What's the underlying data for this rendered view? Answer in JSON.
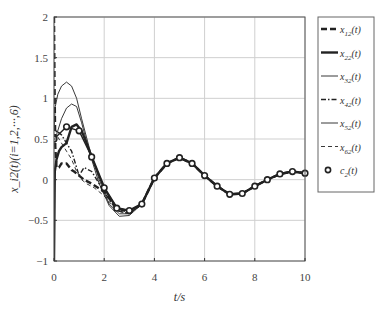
{
  "chart_data": {
    "type": "line",
    "title": "",
    "xlabel": "t/s",
    "ylabel": "x_i2(t)(i=1,2,···,6)",
    "xlim": [
      0,
      10
    ],
    "ylim": [
      -1,
      2
    ],
    "xticks": [
      0,
      2,
      4,
      6,
      8,
      10
    ],
    "yticks": [
      -1,
      -0.5,
      0,
      0.5,
      1,
      1.5,
      2
    ],
    "ytick_labels": [
      "−1",
      "−0.5",
      "0",
      "0.5",
      "1",
      "1.5",
      "2"
    ],
    "grid": true,
    "legend_position": "right-outside",
    "series": [
      {
        "name": "x12(t)",
        "label_main": "x",
        "label_sub": "12",
        "label_tail": "(t)",
        "style": "thick-dashed",
        "x": [
          0,
          0.02,
          0.05,
          0.1,
          0.2,
          0.3,
          0.5,
          0.7,
          0.8,
          1.0,
          1.2,
          1.5,
          2.0,
          2.5,
          3.0,
          3.5,
          4.0,
          4.5,
          5.0,
          5.5,
          6.0,
          6.5,
          7.0,
          7.5,
          8.0,
          8.5,
          9.0,
          9.5,
          10.0
        ],
        "values": [
          2.0,
          1.2,
          0.4,
          0.15,
          0.15,
          0.2,
          0.2,
          0.12,
          0.1,
          0.05,
          0.0,
          -0.05,
          -0.15,
          -0.35,
          -0.4,
          -0.3,
          0.02,
          0.2,
          0.27,
          0.2,
          0.05,
          -0.08,
          -0.18,
          -0.17,
          -0.08,
          0.0,
          0.07,
          0.1,
          0.08
        ]
      },
      {
        "name": "x22(t)",
        "label_main": "x",
        "label_sub": "22",
        "label_tail": "(t)",
        "style": "thick-solid",
        "x": [
          0,
          0.03,
          0.1,
          0.2,
          0.3,
          0.5,
          0.7,
          0.9,
          1.1,
          1.3,
          1.5,
          2.0,
          2.5,
          3.0,
          3.5,
          4.0,
          4.5,
          5.0,
          5.5,
          6.0,
          6.5,
          7.0,
          7.5,
          8.0,
          8.5,
          9.0,
          9.5,
          10.0
        ],
        "values": [
          -1.0,
          0.1,
          0.25,
          0.35,
          0.4,
          0.45,
          0.65,
          0.68,
          0.6,
          0.45,
          0.28,
          -0.1,
          -0.35,
          -0.38,
          -0.3,
          0.02,
          0.2,
          0.27,
          0.2,
          0.05,
          -0.08,
          -0.18,
          -0.17,
          -0.08,
          0.0,
          0.07,
          0.1,
          0.08
        ]
      },
      {
        "name": "x32(t)",
        "label_main": "x",
        "label_sub": "32",
        "label_tail": "(t)",
        "style": "thin-solid",
        "x": [
          0,
          0.05,
          0.15,
          0.3,
          0.5,
          0.7,
          0.9,
          1.1,
          1.4,
          1.8,
          2.2,
          2.6,
          3.0,
          3.5,
          4.0,
          4.5,
          5.0,
          5.5,
          6.0,
          6.5,
          7.0,
          7.5,
          8.0,
          8.5,
          9.0,
          9.5,
          10.0
        ],
        "values": [
          0.6,
          0.9,
          1.05,
          1.15,
          1.2,
          1.15,
          1.0,
          0.75,
          0.4,
          0.0,
          -0.3,
          -0.42,
          -0.42,
          -0.3,
          0.02,
          0.2,
          0.27,
          0.2,
          0.05,
          -0.08,
          -0.18,
          -0.17,
          -0.08,
          0.0,
          0.07,
          0.1,
          0.08
        ]
      },
      {
        "name": "x42(t)",
        "label_main": "x",
        "label_sub": "42",
        "label_tail": "(t)",
        "style": "dash-dot",
        "x": [
          0,
          0.1,
          0.3,
          0.5,
          0.7,
          0.9,
          1.0,
          1.2,
          1.5,
          2.0,
          2.5,
          3.0,
          3.5,
          4.0,
          4.5,
          5.0,
          5.5,
          6.0,
          6.5,
          7.0,
          7.5,
          8.0,
          8.5,
          9.0,
          9.5,
          10.0
        ],
        "values": [
          0.5,
          0.6,
          0.55,
          0.45,
          0.35,
          0.15,
          0.05,
          0.15,
          0.1,
          -0.15,
          -0.38,
          -0.42,
          -0.3,
          0.02,
          0.2,
          0.27,
          0.2,
          0.05,
          -0.08,
          -0.18,
          -0.17,
          -0.08,
          0.0,
          0.07,
          0.1,
          0.08
        ]
      },
      {
        "name": "x52(t)",
        "label_main": "x",
        "label_sub": "52",
        "label_tail": "(t)",
        "style": "thin-solid",
        "x": [
          0,
          0.1,
          0.3,
          0.5,
          0.7,
          0.9,
          1.1,
          1.4,
          1.8,
          2.2,
          2.6,
          3.0,
          3.5,
          4.0,
          4.5,
          5.0,
          5.5,
          6.0,
          6.5,
          7.0,
          7.5,
          8.0,
          8.5,
          9.0,
          9.5,
          10.0
        ],
        "values": [
          0.4,
          0.55,
          0.75,
          0.88,
          0.93,
          0.9,
          0.7,
          0.35,
          -0.05,
          -0.32,
          -0.45,
          -0.44,
          -0.3,
          0.02,
          0.2,
          0.27,
          0.2,
          0.05,
          -0.08,
          -0.18,
          -0.17,
          -0.08,
          0.0,
          0.07,
          0.1,
          0.08
        ]
      },
      {
        "name": "x62(t)",
        "label_main": "x",
        "label_sub": "62",
        "label_tail": "(t)",
        "style": "thin-dashed",
        "x": [
          0,
          0.1,
          0.3,
          0.5,
          0.7,
          0.9,
          1.1,
          1.3,
          1.6,
          2.0,
          2.5,
          3.0,
          3.5,
          4.0,
          4.5,
          5.0,
          5.5,
          6.0,
          6.5,
          7.0,
          7.5,
          8.0,
          8.5,
          9.0,
          9.5,
          10.0
        ],
        "values": [
          0.5,
          0.55,
          0.45,
          0.35,
          0.25,
          0.1,
          0.0,
          -0.05,
          -0.1,
          -0.2,
          -0.38,
          -0.42,
          -0.3,
          0.02,
          0.2,
          0.27,
          0.2,
          0.05,
          -0.08,
          -0.18,
          -0.17,
          -0.08,
          0.0,
          0.07,
          0.1,
          0.08
        ]
      },
      {
        "name": "c2(t)",
        "label_main": "c",
        "label_sub": "2",
        "label_tail": "(t)",
        "style": "circle-markers",
        "x": [
          0,
          0.5,
          1.0,
          1.5,
          2.0,
          2.5,
          3.0,
          3.5,
          4.0,
          4.5,
          5.0,
          5.5,
          6.0,
          6.5,
          7.0,
          7.5,
          8.0,
          8.5,
          9.0,
          9.5,
          10.0
        ],
        "values": [
          0.5,
          0.65,
          0.6,
          0.28,
          -0.1,
          -0.35,
          -0.38,
          -0.3,
          0.02,
          0.2,
          0.27,
          0.2,
          0.05,
          -0.08,
          -0.18,
          -0.17,
          -0.08,
          0.0,
          0.07,
          0.1,
          0.08
        ]
      }
    ]
  },
  "colors": {
    "axis": "#333333",
    "grid": "#cfcfcf",
    "line": "#222222",
    "background": "#ffffff"
  }
}
